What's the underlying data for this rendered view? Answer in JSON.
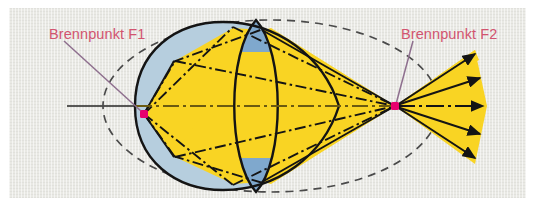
{
  "figure": {
    "title_alt": "Ellipsoidal reflector with condenser lens: rays from focal point F1 are imaged onto focal point F2",
    "language": "de",
    "labels": {
      "focus_1": "Brennpunkt F1",
      "focus_2": "Brennpunkt F2"
    },
    "colors": {
      "background": "#e9e9e4",
      "page": "#ffffff",
      "beam_yellow": "#f9d423",
      "reflector_blue": "#b6cede",
      "lens_blue": "#7fa8cd",
      "outline_black": "#141414",
      "focus_dot_magenta": "#e6006e",
      "label_pink": "#d2546f",
      "leader_line": "#8e6f8e",
      "dashed_ellipse": "#4a4a4a"
    },
    "elements": {
      "reflector_shape": "ovoid-ellipsoidal-mirror",
      "dashed_shape": "ellipse-construction-outline",
      "lens_shape": "biconvex-lens",
      "axis": "optical-axis",
      "ray_style": "dash-dot",
      "output_rays_count": 5,
      "output_rays_direction": "right",
      "focus_1_position_px": [
        135,
        106
      ],
      "focus_2_position_px": [
        386,
        106
      ]
    }
  }
}
